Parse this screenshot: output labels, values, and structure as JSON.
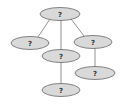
{
  "diagram": {
    "type": "tree",
    "colors": {
      "node_fill": "#d9d9d9",
      "node_stroke": "#666666",
      "edge": "#777777",
      "text": "#333333"
    },
    "nodes": [
      {
        "id": "root",
        "label": "?",
        "cx": 60,
        "cy": 14,
        "rx": 20,
        "ry": 6.5
      },
      {
        "id": "left",
        "label": "?",
        "cx": 30,
        "cy": 43,
        "rx": 19,
        "ry": 6.5
      },
      {
        "id": "middle",
        "label": "?",
        "cx": 61,
        "cy": 56,
        "rx": 19,
        "ry": 6.5
      },
      {
        "id": "right",
        "label": "?",
        "cx": 93,
        "cy": 42,
        "rx": 19,
        "ry": 6.5
      },
      {
        "id": "middle-child",
        "label": "?",
        "cx": 61,
        "cy": 90,
        "rx": 19,
        "ry": 6.5
      },
      {
        "id": "right-child",
        "label": "?",
        "cx": 95,
        "cy": 73,
        "rx": 20,
        "ry": 6.5
      }
    ],
    "edges": [
      {
        "from": "root",
        "to": "left"
      },
      {
        "from": "root",
        "to": "middle"
      },
      {
        "from": "root",
        "to": "right"
      },
      {
        "from": "middle",
        "to": "middle-child"
      },
      {
        "from": "right",
        "to": "right-child"
      }
    ]
  }
}
